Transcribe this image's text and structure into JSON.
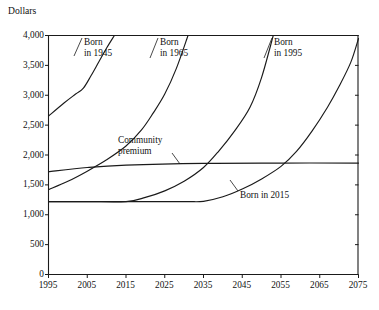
{
  "chart_data": {
    "type": "line",
    "title": "",
    "subtitle": "",
    "xlabel": "",
    "ylabel": "Dollars",
    "xlim": [
      1995,
      2075
    ],
    "ylim": [
      0,
      4000
    ],
    "grid": false,
    "legend_position": "inline-annotations",
    "x_ticks": [
      "1995",
      "2005",
      "2015",
      "2025",
      "2035",
      "2045",
      "2055",
      "2065",
      "2075"
    ],
    "x_tick_values": [
      1995,
      2005,
      2015,
      2025,
      2035,
      2045,
      2055,
      2065,
      2075
    ],
    "y_ticks": [
      "0",
      "500",
      "1,000",
      "1,500",
      "2,000",
      "2,500",
      "3,000",
      "3,500",
      "4,000"
    ],
    "y_tick_values": [
      0,
      500,
      1000,
      1500,
      2000,
      2500,
      3000,
      3500,
      4000
    ],
    "series": [
      {
        "name": "Born in 1945",
        "label": "Born\nin 1945",
        "x": [
          1995,
          1999,
          2002,
          2004,
          2006,
          2008,
          2010,
          2012
        ],
        "values": [
          2650,
          2870,
          3020,
          3120,
          3330,
          3560,
          3790,
          4000
        ]
      },
      {
        "name": "Born in 1965",
        "label": "Born\nin 1965",
        "x": [
          1995,
          2000,
          2005,
          2010,
          2015,
          2019,
          2022,
          2025,
          2028,
          2031
        ],
        "values": [
          1420,
          1560,
          1730,
          1920,
          2150,
          2420,
          2700,
          3020,
          3450,
          4000
        ]
      },
      {
        "name": "Born in 1995",
        "label": "Born\nin 1995",
        "x": [
          1995,
          2005,
          2015,
          2020,
          2025,
          2030,
          2035,
          2039,
          2043,
          2047,
          2050,
          2053
        ],
        "values": [
          1220,
          1220,
          1220,
          1290,
          1400,
          1560,
          1790,
          2070,
          2400,
          2800,
          3300,
          4000
        ]
      },
      {
        "name": "Born in 2015",
        "label": "Born in 2015",
        "x": [
          1995,
          2015,
          2030,
          2035,
          2040,
          2045,
          2050,
          2055,
          2059,
          2063,
          2067,
          2070,
          2073,
          2075
        ],
        "values": [
          1220,
          1220,
          1220,
          1225,
          1300,
          1430,
          1600,
          1810,
          2060,
          2400,
          2800,
          3150,
          3550,
          3950
        ]
      },
      {
        "name": "Community premium",
        "label": "Community\npremium",
        "x": [
          1995,
          2005,
          2015,
          2035,
          2055,
          2075
        ],
        "values": [
          1720,
          1790,
          1830,
          1860,
          1865,
          1865
        ]
      }
    ],
    "annotations": [
      {
        "id": "born-1945",
        "text_line1": "Born",
        "text_line2": "in 1945"
      },
      {
        "id": "born-1965",
        "text_line1": "Born",
        "text_line2": "in 1965"
      },
      {
        "id": "born-1995",
        "text_line1": "Born",
        "text_line2": "in 1995"
      },
      {
        "id": "born-2015",
        "text_line1": "Born in 2015",
        "text_line2": ""
      },
      {
        "id": "community-premium",
        "text_line1": "Community",
        "text_line2": "premium"
      }
    ],
    "colors": {
      "line": "#1a1a1a",
      "axis": "#1a1a1a",
      "background": "#ffffff"
    }
  }
}
